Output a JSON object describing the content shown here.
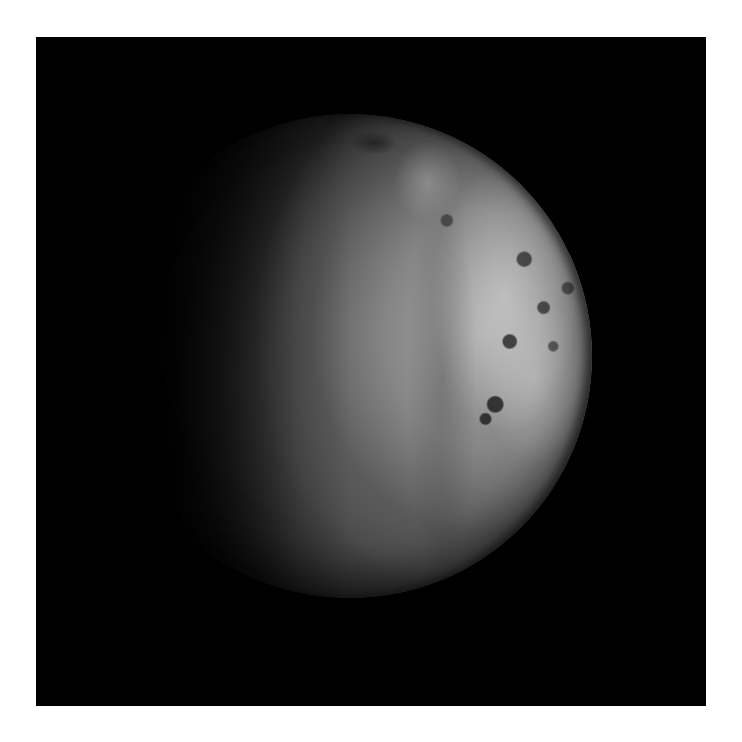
{
  "image": {
    "subject": "moon-crescent-photograph",
    "description": "Gibbous moon illuminated from the right against black space, mottled bright icy terrain on the right limb, dark terminator on the left",
    "colors": {
      "border": "#ffffff",
      "background": "#000000",
      "surface_lit": "#aaaaaa",
      "surface_mid": "#6e6e6e",
      "surface_dark": "#1c1c1c"
    }
  }
}
